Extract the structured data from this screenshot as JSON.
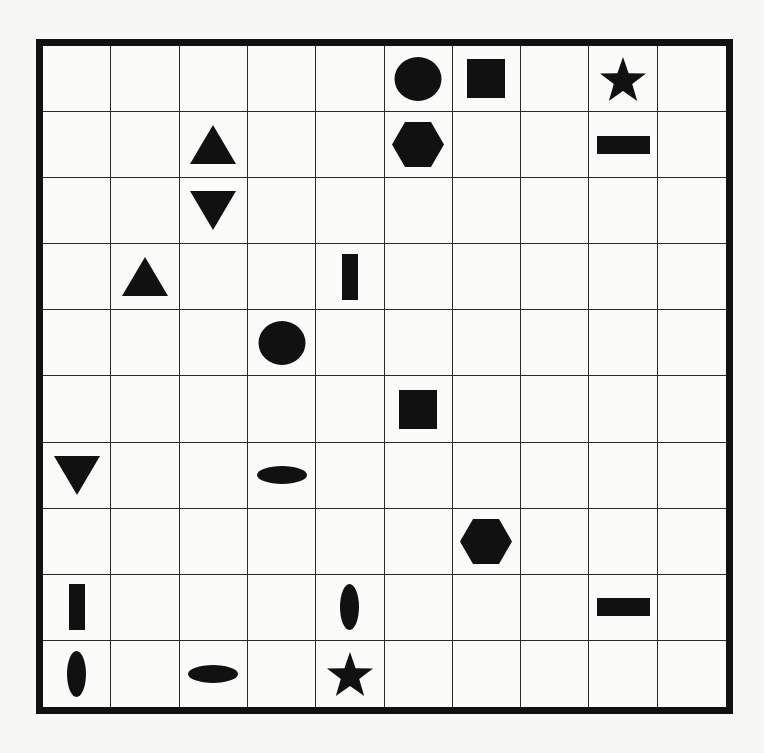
{
  "puzzle": {
    "rows": 10,
    "cols": 10,
    "shape_color": "#111111",
    "grid_line_color": "#2a2a2a",
    "border_color": "#111111",
    "pieces": [
      {
        "row": 0,
        "col": 5,
        "shape": "circle"
      },
      {
        "row": 0,
        "col": 6,
        "shape": "square"
      },
      {
        "row": 0,
        "col": 8,
        "shape": "star"
      },
      {
        "row": 1,
        "col": 2,
        "shape": "triangle-up"
      },
      {
        "row": 1,
        "col": 5,
        "shape": "hexagon"
      },
      {
        "row": 1,
        "col": 8,
        "shape": "bar-horizontal"
      },
      {
        "row": 2,
        "col": 2,
        "shape": "triangle-down"
      },
      {
        "row": 3,
        "col": 1,
        "shape": "triangle-up"
      },
      {
        "row": 3,
        "col": 4,
        "shape": "bar-vertical"
      },
      {
        "row": 4,
        "col": 3,
        "shape": "circle"
      },
      {
        "row": 5,
        "col": 5,
        "shape": "square"
      },
      {
        "row": 6,
        "col": 0,
        "shape": "triangle-down"
      },
      {
        "row": 6,
        "col": 3,
        "shape": "ellipse-horizontal"
      },
      {
        "row": 7,
        "col": 6,
        "shape": "hexagon"
      },
      {
        "row": 8,
        "col": 0,
        "shape": "bar-vertical"
      },
      {
        "row": 8,
        "col": 4,
        "shape": "ellipse-vertical"
      },
      {
        "row": 8,
        "col": 8,
        "shape": "bar-horizontal"
      },
      {
        "row": 9,
        "col": 0,
        "shape": "ellipse-vertical"
      },
      {
        "row": 9,
        "col": 2,
        "shape": "ellipse-horizontal"
      },
      {
        "row": 9,
        "col": 4,
        "shape": "star"
      }
    ]
  }
}
